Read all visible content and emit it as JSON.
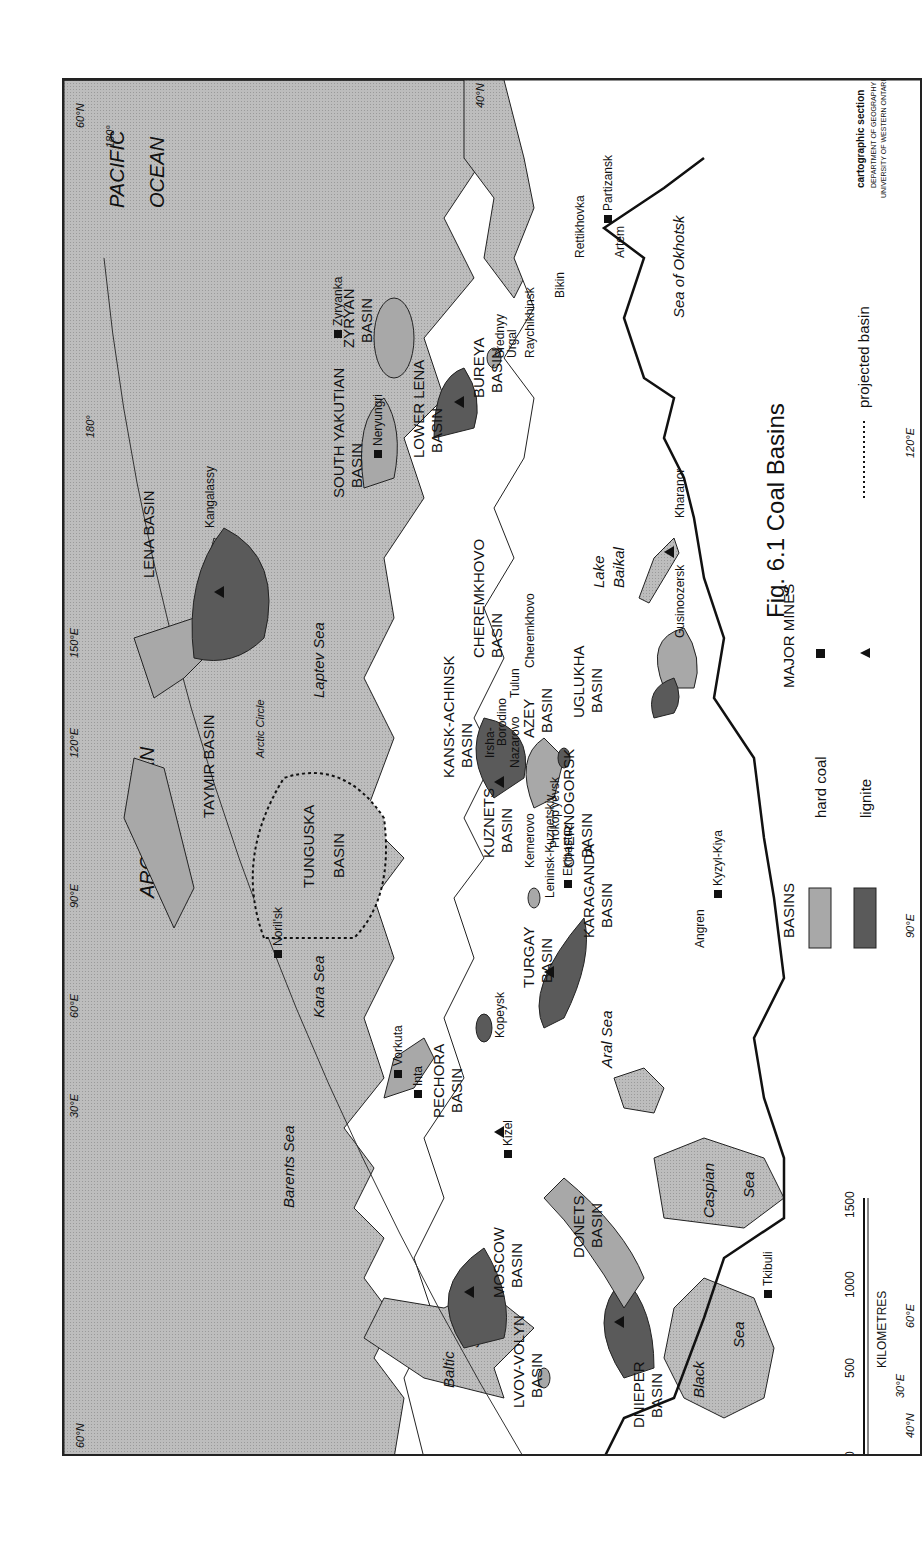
{
  "figure": {
    "title": "Fig. 6.1  Coal Basins",
    "credit": {
      "line1": "cartographic section",
      "line2": "DEPARTMENT OF GEOGRAPHY",
      "line3": "UNIVERSITY OF WESTERN ONTARIO"
    }
  },
  "legend": {
    "basins_heading": "BASINS",
    "mines_heading": "MAJOR MINES",
    "hard_coal": "hard coal",
    "lignite": "lignite",
    "projected": "projected basin",
    "colors": {
      "hard_coal": "#a8a8a8",
      "lignite": "#5a5a5a",
      "water": "#b9b9b9",
      "land": "#ffffff"
    }
  },
  "scale": {
    "unit": "KILOMETRES",
    "ticks": [
      "0",
      "500",
      "1000",
      "1500"
    ]
  },
  "water_labels": {
    "arctic_ocean": "ARCTIC OCEAN",
    "pacific": "PACIFIC",
    "ocean": "OCEAN",
    "barents": "Barents Sea",
    "kara": "Kara Sea",
    "laptev": "Laptev Sea",
    "okhotsk": "Sea of Okhotsk",
    "baltic1": "Baltic",
    "baltic2": "Sea",
    "black1": "Black",
    "black2": "Sea",
    "caspian1": "Caspian",
    "caspian2": "Sea",
    "aral": "Aral Sea",
    "baikal1": "Lake",
    "baikal2": "Baikal"
  },
  "graticule": {
    "lat60_w": "60°N",
    "lat60_e": "60°N",
    "lat40_w": "40°N",
    "lat40_e": "40°N",
    "lon30_n": "30°E",
    "lon30_s": "30°E",
    "lon60_n": "60°E",
    "lon60_s": "60°E",
    "lon90_n": "90°E",
    "lon90_s": "90°E",
    "lon120_n": "120°E",
    "lon120_s": "120°E",
    "lon150_n": "150°E",
    "lon180_a": "180°",
    "lon180_b": "180°",
    "arctic_circle": "Arctic Circle"
  },
  "basins": {
    "lvov": [
      "LVOV-VOLYN",
      "BASIN"
    ],
    "dnieper": [
      "DNIEPER",
      "BASIN"
    ],
    "donets": [
      "DONETS",
      "BASIN"
    ],
    "moscow": [
      "MOSCOW",
      "BASIN"
    ],
    "pechora": [
      "PECHORA",
      "BASIN"
    ],
    "turgay": [
      "TURGAY",
      "BASIN"
    ],
    "karaganda": [
      "KARAGANDA",
      "BASIN"
    ],
    "kuznets": [
      "KUZNETS",
      "BASIN"
    ],
    "chernogorsk": [
      "CHERNOGORSK",
      "BASIN"
    ],
    "kansk": [
      "KANSK-ACHINSK",
      "BASIN"
    ],
    "tunguska": [
      "TUNGUSKA",
      "BASIN"
    ],
    "taymir": [
      "TAYMIR BASIN"
    ],
    "azey": [
      "AZEY",
      "BASIN"
    ],
    "uglukha": [
      "UGLUKHA",
      "BASIN"
    ],
    "cheremkhovo": [
      "CHEREMKHOVO",
      "BASIN"
    ],
    "lena": [
      "LENA BASIN"
    ],
    "zyryan": [
      "ZYRYAN",
      "BASIN"
    ],
    "south_yakutian": [
      "SOUTH YAKUTIAN",
      "BASIN"
    ],
    "lower_lena": [
      "LOWER LENA",
      "BASIN"
    ],
    "bureya": [
      "BUREYA",
      "BASIN"
    ]
  },
  "mines": {
    "tkibuli": "Tkibuli",
    "kizel": "Kizel",
    "kopeysk": "Kopeysk",
    "vorkuta": "Vorkuta",
    "inta": "Inta",
    "norilsk": "Noril'sk",
    "ekibastuz": "Ekibastuz",
    "kemerovo": "Kemerovo",
    "leninsk": "Leninsk-Kuznetskiy",
    "prokopyevsk": "Prokop'yevsk",
    "angren": "Angren",
    "kyzyl_kiya": "Kyzyl-Kiya",
    "irsha": "Irsha-",
    "borodino": "Borodino",
    "nazarovo": "Nazarovo",
    "tulun": "Tulun",
    "cheremkhovo": "Cheremkhovo",
    "gusinoozersk": "Gusinoozersk",
    "kharanor": "Kharanor",
    "kangalassy": "Kangalassy",
    "zyryanka": "Zyryanka",
    "neryungri": "Neryungri",
    "raychikhinsk": "Raychikhinsk",
    "srednyy1": "Srednyy",
    "srednyy2": "Urgal",
    "bikin": "Bikin",
    "rettikhovka": "Rettikhovka",
    "artem": "Artem",
    "partizansk": "Partizansk"
  }
}
